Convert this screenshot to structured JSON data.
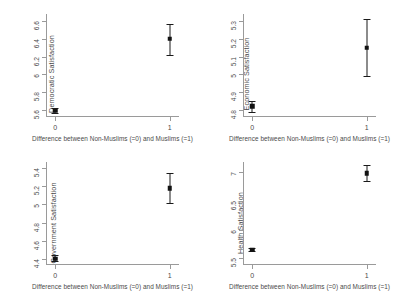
{
  "figure": {
    "x_axis_label": "Difference between Non-Muslims (=0) and Muslims (=1)",
    "x_tick_labels": [
      "0",
      "1"
    ]
  },
  "chart_data": [
    {
      "type": "scatter",
      "title": "",
      "ylabel": "Democratic Satisfaction",
      "xlabel": "Difference between Non-Muslims (=0) and Muslims (=1)",
      "x": [
        0,
        1
      ],
      "xtick_labels": [
        "0",
        "1"
      ],
      "xlim": [
        -0.08,
        1.08
      ],
      "ylim": [
        5.52,
        6.68
      ],
      "yticks": [
        5.6,
        5.8,
        6,
        6.2,
        6.4,
        6.6
      ],
      "ytick_labels": [
        "5.6",
        "5.8",
        "6",
        "6.2",
        "6.4",
        "6.6"
      ],
      "values": [
        5.59,
        6.4
      ],
      "ci_low": [
        5.56,
        6.22
      ],
      "ci_high": [
        5.62,
        6.57
      ],
      "grid": false,
      "legend": "none"
    },
    {
      "type": "scatter",
      "title": "",
      "ylabel": "Economic Satisfaction",
      "xlabel": "Difference between Non-Muslims (=0) and Muslims (=1)",
      "x": [
        0,
        1
      ],
      "xtick_labels": [
        "0",
        "1"
      ],
      "xlim": [
        -0.08,
        1.08
      ],
      "ylim": [
        4.76,
        5.34
      ],
      "yticks": [
        4.8,
        4.9,
        5,
        5.1,
        5.2,
        5.3
      ],
      "ytick_labels": [
        "4.8",
        "4.9",
        "5",
        "5.1",
        "5.2",
        "5.3"
      ],
      "values": [
        4.82,
        5.15
      ],
      "ci_low": [
        4.79,
        4.99
      ],
      "ci_high": [
        4.85,
        5.31
      ],
      "grid": false,
      "legend": "none"
    },
    {
      "type": "scatter",
      "title": "",
      "ylabel": "Government Satisfaction",
      "xlabel": "Difference between Non-Muslims (=0) and Muslims (=1)",
      "x": [
        0,
        1
      ],
      "xtick_labels": [
        "0",
        "1"
      ],
      "xlim": [
        -0.08,
        1.08
      ],
      "ylim": [
        4.33,
        5.47
      ],
      "yticks": [
        4.4,
        4.6,
        4.8,
        5,
        5.2,
        5.4
      ],
      "ytick_labels": [
        "4.4",
        "4.6",
        "4.8",
        "5",
        "5.2",
        "5.4"
      ],
      "values": [
        4.4,
        5.18
      ],
      "ci_low": [
        4.37,
        5.02
      ],
      "ci_high": [
        4.44,
        5.35
      ],
      "grid": false,
      "legend": "none"
    },
    {
      "type": "scatter",
      "title": "",
      "ylabel": "Health Satisfaction",
      "xlabel": "Difference between Non-Muslims (=0) and Muslims (=1)",
      "x": [
        0,
        1
      ],
      "xtick_labels": [
        "0",
        "1"
      ],
      "xlim": [
        -0.08,
        1.08
      ],
      "ylim": [
        5.38,
        7.18
      ],
      "yticks": [
        5.5,
        6,
        6.5,
        7
      ],
      "ytick_labels": [
        "5.5",
        "6",
        "6.5",
        "7"
      ],
      "values": [
        5.65,
        6.98
      ],
      "ci_low": [
        5.62,
        6.85
      ],
      "ci_high": [
        5.68,
        7.12
      ],
      "grid": false,
      "legend": "none"
    }
  ]
}
